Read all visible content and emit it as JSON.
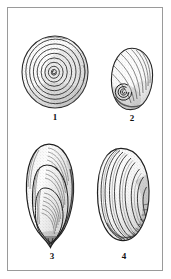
{
  "plate": {
    "background_color": "#ffffff",
    "frame_color": "#9a9a9a",
    "ink_color": "#1a1a1a",
    "stipple_color": "#4a4a4a",
    "medium": "stippled line drawing"
  },
  "figures": [
    {
      "number": "1",
      "label": "1",
      "subject": "planispiral-coiled-shell-apical-view",
      "description": "Flat planispiral gastropod shell seen from above with tightly wound concentric whorls radiating from a central spiral nucleus.",
      "orientation": "apical / top view",
      "outline": "circular",
      "whorl_count": 7,
      "shading": "dense stipple, darker toward the outer right and lower margin"
    },
    {
      "number": "2",
      "label": "2",
      "subject": "ovate-gastropod-shell-with-umbilicus",
      "description": "Ovate to egg-shaped shell with a prominent coiled spire at the lower left and fine growth striae sweeping across the body whorl.",
      "orientation": "umbilical view",
      "outline": "ovate",
      "whorl_count": 3,
      "shading": "light stipple with dark outline at the lower left and base"
    },
    {
      "number": "3",
      "label": "3",
      "subject": "elongate-bivalve-shell",
      "description": "Narrow elongate mussel-like bivalve valve with nested concentric growth stages and a pointed beak or umbo at the lower end.",
      "orientation": "lateral / exterior view",
      "outline": "elongate oval, tapering to a point at the base",
      "growth_stage_count": 3,
      "shading": "stippled interior with strong dark margin along the right edge and base"
    },
    {
      "number": "4",
      "label": "4",
      "subject": "broad-oval-bivalve-shell",
      "description": "Broader oval bivalve valve with strongly marked concentric growth lines arcing out from the upper left margin.",
      "orientation": "lateral / exterior view",
      "outline": "broad oval",
      "growth_line_count": 9,
      "shading": "stippled surface with a dark band at the lower right margin"
    }
  ]
}
